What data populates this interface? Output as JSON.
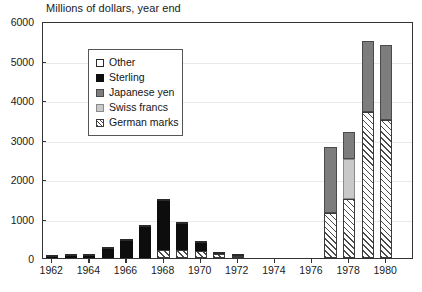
{
  "chart_data": {
    "type": "bar",
    "title": "Millions of dollars, year end",
    "xlabel": "",
    "ylabel": "",
    "ylim": [
      0,
      6000
    ],
    "ytick_labels": [
      "0",
      "1000",
      "2000",
      "3000",
      "4000",
      "5000",
      "6000"
    ],
    "ytick_values": [
      0,
      1000,
      2000,
      3000,
      4000,
      5000,
      6000
    ],
    "grid": true,
    "stacked": true,
    "legend_position": "top-left-inside",
    "x": [
      1962,
      1963,
      1964,
      1965,
      1966,
      1967,
      1968,
      1969,
      1970,
      1971,
      1972,
      1973,
      1974,
      1975,
      1976,
      1977,
      1978,
      1979,
      1980,
      1981
    ],
    "xtick_labels": [
      "1962",
      "1964",
      "1966",
      "1968",
      "1970",
      "1972",
      "1974",
      "1976",
      "1978",
      "1980"
    ],
    "xtick_values": [
      1962,
      1964,
      1966,
      1968,
      1970,
      1972,
      1974,
      1976,
      1978,
      1980
    ],
    "categories": [
      "1962",
      "1963",
      "1964",
      "1965",
      "1966",
      "1967",
      "1968",
      "1969",
      "1970",
      "1971",
      "1972",
      "1973",
      "1974",
      "1975",
      "1976",
      "1977",
      "1978",
      "1979",
      "1980",
      "1981"
    ],
    "series": [
      {
        "name": "German marks",
        "color": "#ffffff",
        "pattern": "diagonal-hatch",
        "values": [
          0,
          0,
          0,
          0,
          0,
          0,
          200,
          200,
          170,
          100,
          60,
          0,
          0,
          0,
          0,
          1150,
          1500,
          3700,
          3500,
          0
        ]
      },
      {
        "name": "Swiss francs",
        "color": "#c9c9c9",
        "values": [
          0,
          0,
          0,
          0,
          0,
          0,
          0,
          0,
          0,
          0,
          0,
          0,
          0,
          0,
          0,
          0,
          1000,
          0,
          0,
          0
        ]
      },
      {
        "name": "Japanese yen",
        "color": "#7d7d7d",
        "values": [
          0,
          0,
          0,
          0,
          0,
          0,
          0,
          0,
          0,
          0,
          0,
          0,
          0,
          0,
          0,
          1650,
          700,
          1800,
          1900,
          0
        ]
      },
      {
        "name": "Sterling",
        "color": "#0d0d0d",
        "values": [
          20,
          40,
          60,
          230,
          430,
          780,
          1250,
          650,
          200,
          0,
          0,
          0,
          0,
          0,
          0,
          0,
          0,
          0,
          0,
          0
        ]
      },
      {
        "name": "Other",
        "color": "#ffffff",
        "values": [
          20,
          10,
          10,
          20,
          20,
          20,
          20,
          20,
          20,
          20,
          20,
          0,
          0,
          0,
          0,
          0,
          0,
          0,
          0,
          0
        ]
      }
    ],
    "totals": [
      40,
      50,
      70,
      250,
      450,
      800,
      1470,
      870,
      390,
      120,
      80,
      0,
      0,
      0,
      0,
      2800,
      3200,
      5500,
      5400,
      0
    ]
  },
  "legend": {
    "items": [
      {
        "label": "Other",
        "swatch": "swatch-other"
      },
      {
        "label": "Sterling",
        "swatch": "swatch-sterling"
      },
      {
        "label": "Japanese yen",
        "swatch": "swatch-japanese-yen"
      },
      {
        "label": "Swiss francs",
        "swatch": "swatch-swiss-francs"
      },
      {
        "label": "German marks",
        "swatch": "swatch-german-marks"
      }
    ]
  }
}
